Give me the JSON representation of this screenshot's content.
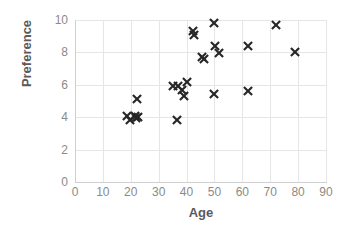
{
  "chart_data": {
    "type": "scatter",
    "title": "",
    "xlabel": "Age",
    "ylabel": "Preference",
    "xlim": [
      0,
      90
    ],
    "ylim": [
      0,
      10
    ],
    "xticks": [
      0,
      10,
      20,
      30,
      40,
      50,
      60,
      70,
      80,
      90
    ],
    "yticks": [
      0,
      2,
      4,
      6,
      8,
      10
    ],
    "grid": true,
    "legend": "none",
    "marker": "x-cross",
    "marker_color": "#262626",
    "grid_color": "#e6e6e6",
    "axis_color": "#d0d0d0",
    "tick_label_color": "#8a8a8a",
    "axis_title_color": "#5a5a5a",
    "background": "#ffffff",
    "points": [
      {
        "x": 18.5,
        "y": 4.05
      },
      {
        "x": 19.8,
        "y": 3.85
      },
      {
        "x": 21.4,
        "y": 4.1
      },
      {
        "x": 22.0,
        "y": 3.95
      },
      {
        "x": 22.6,
        "y": 4.0
      },
      {
        "x": 22.2,
        "y": 5.1
      },
      {
        "x": 36.5,
        "y": 3.8
      },
      {
        "x": 35.0,
        "y": 5.9
      },
      {
        "x": 37.0,
        "y": 5.95
      },
      {
        "x": 38.4,
        "y": 5.7
      },
      {
        "x": 39.2,
        "y": 5.3
      },
      {
        "x": 40.2,
        "y": 6.2
      },
      {
        "x": 42.3,
        "y": 9.35
      },
      {
        "x": 42.6,
        "y": 9.1
      },
      {
        "x": 45.4,
        "y": 7.7
      },
      {
        "x": 46.2,
        "y": 7.6
      },
      {
        "x": 49.8,
        "y": 9.8
      },
      {
        "x": 50.2,
        "y": 8.4
      },
      {
        "x": 51.6,
        "y": 7.95
      },
      {
        "x": 50.0,
        "y": 5.45
      },
      {
        "x": 62.0,
        "y": 8.4
      },
      {
        "x": 62.2,
        "y": 5.6
      },
      {
        "x": 72.0,
        "y": 9.7
      },
      {
        "x": 79.0,
        "y": 8.0
      }
    ]
  }
}
